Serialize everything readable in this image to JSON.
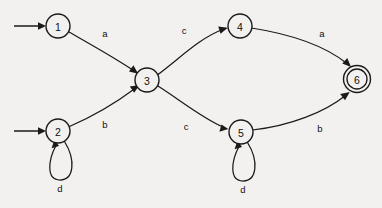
{
  "diagram": {
    "type": "state-transition-diagram",
    "background_color": "#f2f1ef",
    "stroke_color": "#1a1a1a",
    "width": 382,
    "height": 208
  },
  "states": [
    {
      "id": "1",
      "label": "1",
      "cx": 58,
      "cy": 26,
      "r": 12,
      "accepting": false,
      "start": true
    },
    {
      "id": "2",
      "label": "2",
      "cx": 58,
      "cy": 131,
      "r": 12,
      "accepting": false,
      "start": true
    },
    {
      "id": "3",
      "label": "3",
      "cx": 147,
      "cy": 80,
      "r": 12,
      "accepting": false,
      "start": false
    },
    {
      "id": "4",
      "label": "4",
      "cx": 240,
      "cy": 26,
      "r": 12,
      "accepting": false,
      "start": false
    },
    {
      "id": "5",
      "label": "5",
      "cx": 241,
      "cy": 132,
      "r": 12,
      "accepting": false,
      "start": false
    },
    {
      "id": "6",
      "label": "6",
      "cx": 357,
      "cy": 79,
      "r": 12,
      "accepting": true,
      "start": false
    }
  ],
  "transitions": [
    {
      "from": "1",
      "to": "3",
      "symbol": "a",
      "label_x": 105,
      "label_y": 33
    },
    {
      "from": "2",
      "to": "3",
      "symbol": "b",
      "label_x": 105,
      "label_y": 124
    },
    {
      "from": "3",
      "to": "4",
      "symbol": "c",
      "label_x": 184,
      "label_y": 30
    },
    {
      "from": "3",
      "to": "5",
      "symbol": "c",
      "label_x": 186,
      "label_y": 126
    },
    {
      "from": "4",
      "to": "6",
      "symbol": "a",
      "label_x": 322,
      "label_y": 33
    },
    {
      "from": "5",
      "to": "6",
      "symbol": "b",
      "label_x": 320,
      "label_y": 128
    }
  ],
  "self_loops": [
    {
      "state": "2",
      "symbol": "d",
      "label_x": 60,
      "label_y": 188
    },
    {
      "state": "5",
      "symbol": "d",
      "label_x": 243,
      "label_y": 189
    }
  ],
  "start_markers": [
    {
      "state": "1",
      "x1": 14,
      "y1": 26,
      "x2": 44,
      "y2": 26
    },
    {
      "state": "2",
      "x1": 14,
      "y1": 131,
      "x2": 44,
      "y2": 131
    }
  ]
}
